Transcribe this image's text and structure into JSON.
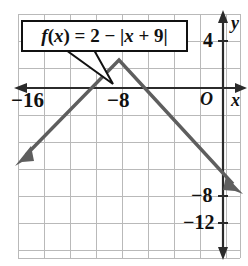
{
  "figure": {
    "type": "coordinate-graph",
    "background": "#ffffff",
    "grid_color": "#b9b9b9",
    "axis_color": "#2b2b2b",
    "curve_color": "#5e5e5e",
    "callout": {
      "equation_plain": "f(x) = 2 - |x + 9|",
      "parts": {
        "f": "f",
        "open_paren": "(",
        "x1": "x",
        "close_paren": ")",
        "equals": " = ",
        "two": "2",
        "minus": " − ",
        "bar_open": "|",
        "x2": "x",
        "plus": " + ",
        "nine": "9",
        "bar_close": "|"
      }
    },
    "axis_labels": {
      "x_axis_name": "x",
      "y_axis_name": "y",
      "origin": "O"
    },
    "x_ticks": [
      {
        "label": "−16",
        "value": -16
      },
      {
        "label": "−8",
        "value": -8
      }
    ],
    "y_ticks": [
      {
        "label": "4",
        "value": 4
      },
      {
        "label": "−8",
        "value": -8
      },
      {
        "label": "−12",
        "value": -12
      }
    ]
  },
  "chart_data": {
    "type": "line",
    "title": "",
    "xlabel": "x",
    "ylabel": "y",
    "equation": "f(x) = 2 - |x + 9|",
    "vertex": [
      -9,
      2
    ],
    "slope_left": 1,
    "slope_right": -1,
    "xlim": [
      -20,
      -0.5
    ],
    "ylim": [
      -14,
      6
    ],
    "grid": true,
    "legend": "none",
    "series": [
      {
        "name": "f(x) = 2 - |x + 9|",
        "x": [
          -18.5,
          -9,
          0.7
        ],
        "y": [
          -7.5,
          2,
          -7.7
        ]
      }
    ],
    "x_tick_labels": [
      "−16",
      "−8"
    ],
    "x_tick_values": [
      -16,
      -8
    ],
    "y_tick_labels": [
      "4",
      "−8",
      "−12"
    ],
    "y_tick_values": [
      4,
      -8,
      -12
    ]
  }
}
